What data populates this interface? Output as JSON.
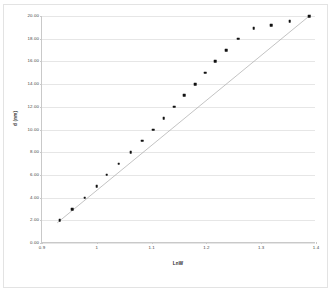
{
  "chart_data": {
    "type": "scatter",
    "title": "",
    "xlabel": "LnW",
    "ylabel": "d (nm)",
    "xlim": [
      0.9,
      1.4
    ],
    "ylim": [
      0.0,
      20.0
    ],
    "grid": "horizontal",
    "legend": "none",
    "x_ticks": [
      "0.9",
      "1",
      "1.1",
      "1.2",
      "1.3",
      "1.4"
    ],
    "x_tick_values": [
      0.9,
      1.0,
      1.1,
      1.2,
      1.3,
      1.4
    ],
    "y_ticks": [
      "0.00",
      "2.00",
      "4.00",
      "6.00",
      "8.00",
      "10.00",
      "12.00",
      "14.00",
      "16.00",
      "18.00",
      "20.00"
    ],
    "y_tick_values": [
      0,
      2,
      4,
      6,
      8,
      10,
      12,
      14,
      16,
      18,
      20
    ],
    "series": [
      {
        "name": "data",
        "marker": "filled-square",
        "marker_color": "#111111",
        "line_color": "#9a9a9a",
        "x": [
          0.932,
          0.955,
          0.978,
          1.0,
          1.018,
          1.04,
          1.062,
          1.083,
          1.103,
          1.122,
          1.141,
          1.16,
          1.18,
          1.198,
          1.216,
          1.236,
          1.258,
          1.286,
          1.318,
          1.352,
          1.388
        ],
        "y": [
          2.0,
          3.0,
          4.0,
          4.98,
          6.0,
          7.0,
          8.0,
          9.0,
          10.0,
          11.0,
          12.0,
          13.0,
          14.0,
          15.0,
          16.0,
          17.0,
          18.0,
          18.95,
          19.2,
          19.55,
          20.0
        ]
      }
    ],
    "trendline": {
      "type": "linear",
      "from": [
        0.928,
        1.7
      ],
      "to": [
        1.392,
        20.1
      ],
      "color": "#a8a8a8"
    }
  },
  "style": {
    "background": "#ffffff",
    "gridline_color": "#e6e6e6",
    "axis_color": "#c9c9c9",
    "frame_color": "#e3e3e3",
    "tick_label_color": "#3f3f3f",
    "axis_title_color": "#2b2b2b"
  }
}
